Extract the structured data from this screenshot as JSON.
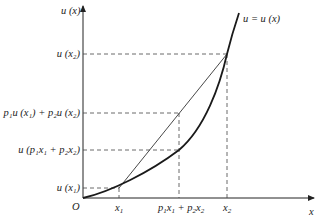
{
  "diagram": {
    "origin_label": "O",
    "axes": {
      "x_label": "x",
      "y_label": "u (x)"
    },
    "curve_label": "u = u (x)",
    "x_ticks": [
      {
        "id": "x1",
        "text": "x",
        "sub": "1"
      },
      {
        "id": "mix",
        "parts": [
          {
            "t": "p",
            "s": "1"
          },
          {
            "t": "x",
            "s": "1"
          },
          {
            "t": " + p",
            "s": "2"
          },
          {
            "t": "x",
            "s": "2"
          }
        ]
      },
      {
        "id": "x2",
        "text": "x",
        "sub": "2"
      }
    ],
    "y_ticks": [
      {
        "id": "ux2",
        "label": "u (x₂)"
      },
      {
        "id": "chord",
        "label": "p₁u (x₁) + p₂u (x₂)"
      },
      {
        "id": "umix",
        "label": "u (p₁x₁ + p₂x₂)"
      },
      {
        "id": "ux1",
        "label": "u (x₁)"
      }
    ],
    "colors": {
      "axis": "#222222",
      "curve": "#1a1a1a",
      "chord": "#333333",
      "dashed": "#444444"
    }
  }
}
